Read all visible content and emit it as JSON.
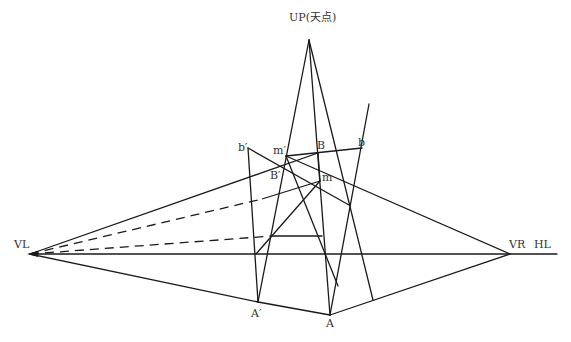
{
  "diagram": {
    "stroke_color": "#1a1a1a",
    "label_color": "#333333",
    "labels": {
      "up": "UP(天点)",
      "vl": "VL",
      "vr": "VR",
      "hl": "HL",
      "a": "A",
      "a_prime": "A′",
      "b": "B",
      "b_prime": "B′",
      "m": "m",
      "m_prime": "m′",
      "b_lower": "b",
      "b_lower_prime": "b′"
    },
    "points": {
      "UP": [
        309,
        40
      ],
      "VL": [
        30,
        254
      ],
      "VR": [
        510,
        254
      ],
      "HL_end": [
        557,
        254
      ],
      "A": [
        330,
        315
      ],
      "A_prime": [
        258,
        302
      ],
      "B": [
        318,
        153
      ],
      "B_prime": [
        284,
        166
      ],
      "m": [
        320,
        181
      ],
      "m_prime": [
        286,
        156
      ],
      "b": [
        362,
        148
      ],
      "b_prime": [
        248,
        148
      ]
    }
  }
}
